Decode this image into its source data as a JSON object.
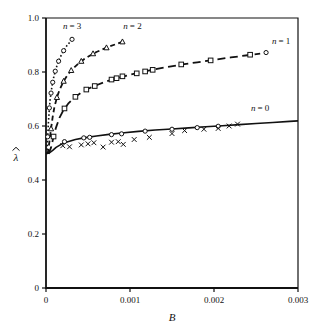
{
  "figure": {
    "caption_fragment": "",
    "background": "#ffffff",
    "ink": "#111111"
  },
  "chart_data": {
    "type": "line",
    "title": "",
    "xlabel": "B",
    "ylabel": "λ",
    "ylabel_has_hat": true,
    "xlim": [
      0,
      0.003
    ],
    "ylim": [
      0,
      1.0
    ],
    "xticks": [
      0,
      0.001,
      0.002,
      0.003
    ],
    "xtick_labels": [
      "0",
      "0.001",
      "0.002",
      "0.003"
    ],
    "yticks": [
      0,
      0.2,
      0.4,
      0.6,
      0.8,
      1.0
    ],
    "ytick_labels": [
      "0",
      "0.2",
      "0.4",
      "0.6",
      "0.8",
      "1.0"
    ],
    "grid": false,
    "legend_position": "inline-annotations",
    "convergence_point": {
      "x": 5e-05,
      "y": 0.5
    },
    "series": [
      {
        "name": "n = 0",
        "label": "n = 0",
        "line_style": "solid",
        "line_width": 1.6,
        "marker": "none",
        "label_x": 0.00255,
        "label_y": 0.655,
        "curve": [
          [
            0.0,
            0.497
          ],
          [
            4e-05,
            0.5
          ],
          [
            8e-05,
            0.51
          ],
          [
            0.00012,
            0.521
          ],
          [
            0.00018,
            0.532
          ],
          [
            0.00025,
            0.541
          ],
          [
            0.00035,
            0.55
          ],
          [
            0.00045,
            0.556
          ],
          [
            0.0006,
            0.563
          ],
          [
            0.00075,
            0.569
          ],
          [
            0.0009,
            0.574
          ],
          [
            0.0011,
            0.58
          ],
          [
            0.0013,
            0.585
          ],
          [
            0.0015,
            0.589
          ],
          [
            0.0017,
            0.593
          ],
          [
            0.0019,
            0.597
          ],
          [
            0.0021,
            0.601
          ],
          [
            0.0023,
            0.605
          ],
          [
            0.0025,
            0.609
          ],
          [
            0.0027,
            0.613
          ],
          [
            0.0029,
            0.617
          ],
          [
            0.003,
            0.619
          ]
        ],
        "points_circle": [
          [
            0.00022,
            0.542
          ],
          [
            0.00045,
            0.556
          ],
          [
            0.00052,
            0.558
          ],
          [
            0.00078,
            0.568
          ],
          [
            0.0009,
            0.571
          ],
          [
            0.00118,
            0.581
          ],
          [
            0.0015,
            0.588
          ],
          [
            0.0018,
            0.594
          ],
          [
            0.00205,
            0.599
          ]
        ],
        "points_cross": [
          [
            0.0002,
            0.527
          ],
          [
            0.00028,
            0.523
          ],
          [
            0.00042,
            0.53
          ],
          [
            0.0005,
            0.534
          ],
          [
            0.00057,
            0.538
          ],
          [
            0.00068,
            0.522
          ],
          [
            0.00078,
            0.54
          ],
          [
            0.00086,
            0.542
          ],
          [
            0.00092,
            0.532
          ],
          [
            0.00105,
            0.55
          ],
          [
            0.00123,
            0.558
          ],
          [
            0.0015,
            0.572
          ],
          [
            0.00165,
            0.583
          ],
          [
            0.00188,
            0.588
          ],
          [
            0.00205,
            0.591
          ],
          [
            0.00218,
            0.6
          ],
          [
            0.00228,
            0.607
          ]
        ]
      },
      {
        "name": "n = 1",
        "label": "n = 1",
        "line_style": "long-dash",
        "line_width": 1.8,
        "marker": "square",
        "label_x": 0.0028,
        "label_y": 0.905,
        "curve": [
          [
            3e-05,
            0.497
          ],
          [
            6e-05,
            0.52
          ],
          [
            9e-05,
            0.56
          ],
          [
            0.00012,
            0.595
          ],
          [
            0.00016,
            0.63
          ],
          [
            0.00021,
            0.66
          ],
          [
            0.00027,
            0.685
          ],
          [
            0.00034,
            0.706
          ],
          [
            0.00042,
            0.724
          ],
          [
            0.0005,
            0.738
          ],
          [
            0.0006,
            0.751
          ],
          [
            0.0007,
            0.763
          ],
          [
            0.00082,
            0.775
          ],
          [
            0.00095,
            0.786
          ],
          [
            0.0011,
            0.797
          ],
          [
            0.00125,
            0.807
          ],
          [
            0.00142,
            0.817
          ],
          [
            0.0016,
            0.827
          ],
          [
            0.0018,
            0.836
          ],
          [
            0.002,
            0.845
          ],
          [
            0.0022,
            0.854
          ],
          [
            0.0024,
            0.862
          ],
          [
            0.00255,
            0.868
          ]
        ],
        "points_square": [
          [
            9e-05,
            0.561
          ],
          [
            0.00022,
            0.665
          ],
          [
            0.00035,
            0.708
          ],
          [
            0.00048,
            0.735
          ],
          [
            0.00058,
            0.748
          ],
          [
            0.00078,
            0.772
          ],
          [
            0.00084,
            0.777
          ],
          [
            0.00091,
            0.784
          ],
          [
            0.00108,
            0.795
          ],
          [
            0.00118,
            0.802
          ],
          [
            0.00127,
            0.808
          ],
          [
            0.00161,
            0.828
          ],
          [
            0.00196,
            0.843
          ],
          [
            0.00243,
            0.864
          ]
        ],
        "points_circle": [
          [
            0.00262,
            0.872
          ]
        ]
      },
      {
        "name": "n = 2",
        "label": "n = 2",
        "line_style": "dash",
        "line_width": 1.8,
        "marker": "triangle",
        "label_x": 0.00103,
        "label_y": 0.96,
        "curve": [
          [
            2e-05,
            0.497
          ],
          [
            4e-05,
            0.54
          ],
          [
            6e-05,
            0.59
          ],
          [
            8e-05,
            0.635
          ],
          [
            0.0001,
            0.67
          ],
          [
            0.00013,
            0.706
          ],
          [
            0.00016,
            0.733
          ],
          [
            0.0002,
            0.76
          ],
          [
            0.00024,
            0.781
          ],
          [
            0.00029,
            0.802
          ],
          [
            0.00034,
            0.818
          ],
          [
            0.0004,
            0.835
          ],
          [
            0.00046,
            0.849
          ],
          [
            0.00053,
            0.862
          ],
          [
            0.0006,
            0.874
          ],
          [
            0.00068,
            0.885
          ],
          [
            0.00076,
            0.895
          ],
          [
            0.00084,
            0.904
          ],
          [
            0.00092,
            0.913
          ]
        ],
        "points_triangle": [
          [
            6e-05,
            0.59
          ],
          [
            0.00013,
            0.706
          ],
          [
            0.00021,
            0.766
          ],
          [
            0.0003,
            0.806
          ],
          [
            0.00042,
            0.84
          ],
          [
            0.00056,
            0.868
          ],
          [
            0.00072,
            0.89
          ],
          [
            0.00091,
            0.912
          ]
        ]
      },
      {
        "name": "n = 3",
        "label": "n = 3",
        "line_style": "dotted",
        "line_width": 1.6,
        "marker": "circle",
        "label_x": 0.00031,
        "label_y": 0.96,
        "curve": [
          [
            1e-05,
            0.497
          ],
          [
            2e-05,
            0.56
          ],
          [
            3e-05,
            0.62
          ],
          [
            4e-05,
            0.665
          ],
          [
            5e-05,
            0.7
          ],
          [
            7e-05,
            0.745
          ],
          [
            9e-05,
            0.778
          ],
          [
            0.00011,
            0.803
          ],
          [
            0.00013,
            0.823
          ],
          [
            0.00016,
            0.848
          ],
          [
            0.00019,
            0.868
          ],
          [
            0.00022,
            0.884
          ],
          [
            0.00025,
            0.898
          ],
          [
            0.00029,
            0.913
          ],
          [
            0.00033,
            0.926
          ]
        ],
        "points_circle": [
          [
            2e-05,
            0.56
          ],
          [
            4e-05,
            0.667
          ],
          [
            6e-05,
            0.722
          ],
          [
            8e-05,
            0.762
          ],
          [
            0.00011,
            0.803
          ],
          [
            0.00015,
            0.84
          ],
          [
            0.00021,
            0.879
          ],
          [
            0.00031,
            0.921
          ]
        ]
      }
    ]
  }
}
